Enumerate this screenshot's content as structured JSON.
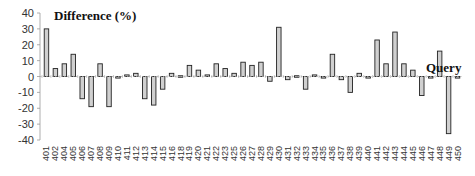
{
  "chart_data": {
    "type": "bar",
    "title": "Difference (%)",
    "annotation": "Query",
    "xlabel": "",
    "ylabel": "Difference (%)",
    "ylim": [
      -40,
      40
    ],
    "yticks": [
      40,
      30,
      20,
      10,
      0,
      -10,
      -20,
      -30,
      -40
    ],
    "grid": false,
    "legend": null,
    "categories": [
      "401",
      "402",
      "404",
      "405",
      "406",
      "407",
      "408",
      "409",
      "410",
      "411",
      "412",
      "413",
      "414",
      "415",
      "416",
      "418",
      "419",
      "420",
      "421",
      "422",
      "423",
      "425",
      "426",
      "427",
      "428",
      "429",
      "430",
      "431",
      "432",
      "433",
      "434",
      "435",
      "436",
      "437",
      "438",
      "439",
      "440",
      "441",
      "442",
      "443",
      "444",
      "445",
      "446",
      "447",
      "448",
      "449",
      "450"
    ],
    "values": [
      30,
      5,
      8,
      14,
      -14,
      -19,
      8,
      -19,
      -1,
      1,
      2,
      -14,
      -18,
      -8,
      2,
      0,
      7,
      4,
      1,
      8,
      5,
      2,
      9,
      7,
      9,
      -3,
      31,
      -2,
      0,
      -8,
      1,
      -1,
      14,
      -2,
      -10,
      2,
      -1,
      23,
      8,
      28,
      8,
      4,
      -12,
      -1,
      16,
      -36,
      -1
    ],
    "bar_fill": "#d0d0d0",
    "bar_stroke": "#222222"
  }
}
